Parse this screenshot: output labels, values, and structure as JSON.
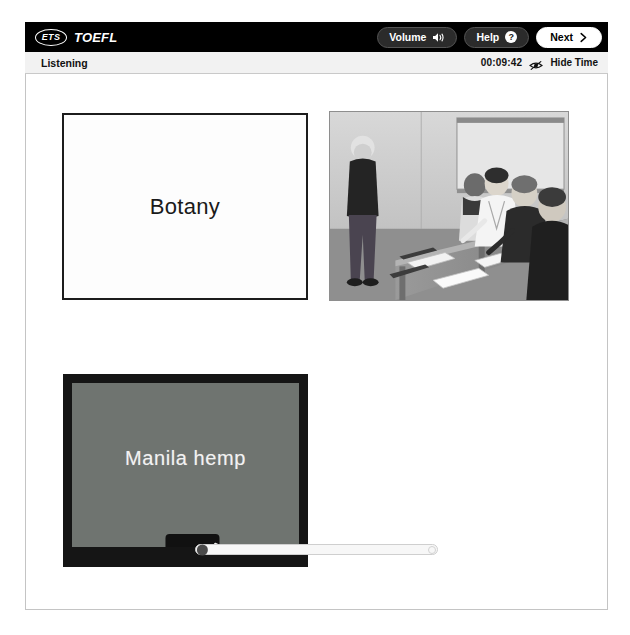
{
  "header": {
    "brand_ets": "ETS",
    "brand_toefl": "TOEFL",
    "volume_label": "Volume",
    "help_label": "Help",
    "help_glyph": "?",
    "next_label": "Next"
  },
  "section_bar": {
    "section_title": "Listening",
    "clock": "00:09:42",
    "hide_time_label": "Hide Time"
  },
  "stage": {
    "slide_title": "Botany",
    "chalkboard_text": "Manila hemp",
    "photo_alt": "Professor standing in front of seated students in a classroom"
  },
  "progress": {
    "value_percent": 1
  },
  "colors": {
    "top_bar": "#000000",
    "section_bar": "#f2f2f2",
    "pill_dark": "#2b2b2b",
    "pill_light": "#ffffff",
    "chalkboard_surface": "#6f7470",
    "chalkboard_frame": "#151515",
    "progress_knob": "#4a4a4a"
  }
}
